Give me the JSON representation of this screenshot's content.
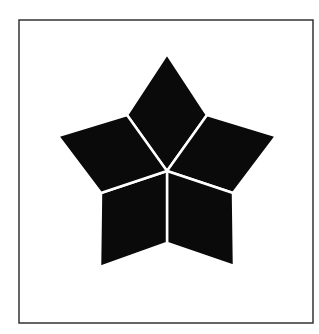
{
  "diagram": {
    "title": "",
    "colors": {
      "background": "#ffffff",
      "frame": "#333333",
      "fill": "#0a0a0a",
      "gap": "#ffffff"
    },
    "frame": {
      "x": 19,
      "y": 20,
      "width": 294,
      "height": 303,
      "stroke_width": 1.5
    },
    "center": [
      167,
      171
    ],
    "outer_points": {
      "top": [
        167,
        54
      ],
      "right": [
        276,
        136
      ],
      "bottom_right": [
        234,
        266
      ],
      "bottom_left": [
        100,
        267
      ],
      "left": [
        58,
        136
      ]
    },
    "inner_points": {
      "upper_right": [
        207,
        115
      ],
      "lower_right": [
        233,
        193
      ],
      "bottom": [
        167,
        243
      ],
      "lower_left": [
        101,
        193
      ],
      "upper_left": [
        127,
        115
      ]
    },
    "rhombi": [
      {
        "name": "top",
        "points": [
          [
            167,
            171
          ],
          [
            127,
            115
          ],
          [
            167,
            54
          ],
          [
            207,
            115
          ]
        ]
      },
      {
        "name": "right",
        "points": [
          [
            167,
            171
          ],
          [
            207,
            115
          ],
          [
            276,
            136
          ],
          [
            233,
            193
          ]
        ]
      },
      {
        "name": "bottom-right",
        "points": [
          [
            167,
            171
          ],
          [
            233,
            193
          ],
          [
            234,
            266
          ],
          [
            167,
            243
          ]
        ]
      },
      {
        "name": "bottom-left",
        "points": [
          [
            167,
            171
          ],
          [
            167,
            243
          ],
          [
            100,
            267
          ],
          [
            101,
            193
          ]
        ]
      },
      {
        "name": "left",
        "points": [
          [
            167,
            171
          ],
          [
            101,
            193
          ],
          [
            58,
            136
          ],
          [
            127,
            115
          ]
        ]
      }
    ],
    "gap_width": 2.5
  }
}
